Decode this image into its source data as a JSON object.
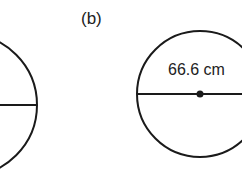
{
  "figure": {
    "part_label": "(b)",
    "circle_b": {
      "diameter_label": "66.6 cm",
      "measure": "diameter",
      "center_point": true
    },
    "circle_a": {
      "partial": true,
      "has_diameter_line": true
    }
  }
}
